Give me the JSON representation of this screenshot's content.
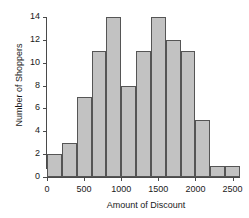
{
  "chart_data": {
    "type": "bar",
    "title": "",
    "xlabel": "Amount of Discount",
    "ylabel": "Number of Shoppers",
    "bin_width": 200,
    "bin_edges": [
      0,
      200,
      400,
      600,
      800,
      1000,
      1200,
      1400,
      1600,
      1800,
      2000,
      2200,
      2400,
      2600
    ],
    "categories": [
      "0-200",
      "200-400",
      "400-600",
      "600-800",
      "800-1000",
      "1000-1200",
      "1200-1400",
      "1400-1600",
      "1600-1800",
      "1800-2000",
      "2000-2200",
      "2200-2400",
      "2400-2600"
    ],
    "values": [
      2,
      3,
      7,
      11,
      14,
      8,
      11,
      14,
      12,
      11,
      5,
      1,
      1
    ],
    "xlim": [
      0,
      2600
    ],
    "ylim": [
      0,
      14
    ],
    "xticks": [
      0,
      500,
      1000,
      1500,
      2000,
      2500
    ],
    "xtick_labels": [
      "0",
      "500",
      "1000",
      "1500",
      "2000",
      "2500"
    ],
    "yticks": [
      0,
      2,
      4,
      6,
      8,
      10,
      12,
      14
    ],
    "ytick_labels": [
      "0",
      "2",
      "4",
      "6",
      "8",
      "10",
      "12",
      "14"
    ],
    "grid": false,
    "legend": null,
    "bar_fill_color": "#c2c2c2",
    "bar_edge_color": "#555555",
    "axis_color": "#4a4a4a",
    "background_color": "#ffffff"
  }
}
